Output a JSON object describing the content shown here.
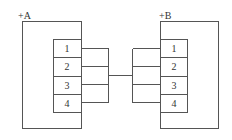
{
  "diagram": {
    "type": "terminal-connection",
    "devices": [
      {
        "label": "+A",
        "terminals": [
          "1",
          "2",
          "3",
          "4"
        ]
      },
      {
        "label": "+B",
        "terminals": [
          "1",
          "2",
          "3",
          "4"
        ]
      }
    ],
    "connection": "A terminals 1-4 bundled and connected to B terminals 1-4",
    "line_color": "#555555"
  }
}
